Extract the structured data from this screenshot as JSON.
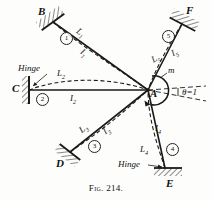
{
  "figure": {
    "caption": "Fig. 214.",
    "background_color": "#fdfdfb",
    "ink_color": "#1a1a1a"
  },
  "joint": {
    "label": "A",
    "moment_label": "m",
    "rotation_label": "θ=1",
    "x": 148,
    "y": 90
  },
  "supports": [
    {
      "label": "B",
      "type": "fixed-hatched",
      "x": 48,
      "y": 16
    },
    {
      "label": "C",
      "type": "fixed-wall",
      "x": 16,
      "y": 89
    },
    {
      "label": "D",
      "type": "fixed-hatched",
      "x": 60,
      "y": 160
    },
    {
      "label": "E",
      "type": "hinge-hatched",
      "x": 172,
      "y": 180
    },
    {
      "label": "F",
      "type": "fixed-hatched",
      "x": 188,
      "y": 14
    }
  ],
  "members": [
    {
      "number": "1",
      "length_label": "L",
      "length_sub": "1",
      "inertia_label": "I",
      "inertia_sub": "1",
      "from": "B",
      "to": "A",
      "deflected": true
    },
    {
      "number": "2",
      "length_label": "L",
      "length_sub": "2",
      "inertia_label": "I",
      "inertia_sub": "2",
      "from": "C",
      "to": "A",
      "deflected": true
    },
    {
      "number": "3",
      "length_label": "L",
      "length_sub": "3",
      "inertia_label": "I",
      "inertia_sub": "3",
      "from": "D",
      "to": "A",
      "deflected": true
    },
    {
      "number": "4",
      "length_label": "L",
      "length_sub": "4",
      "inertia_label": "I",
      "inertia_sub": "4",
      "from": "E",
      "to": "A",
      "deflected": true
    },
    {
      "number": "5",
      "length_label": "L",
      "length_sub": "5",
      "inertia_label": "I",
      "inertia_sub": "5",
      "from": "F",
      "to": "A",
      "deflected": true
    }
  ],
  "annotations": {
    "hinge_left": "Hinge",
    "hinge_bottom": "Hinge"
  }
}
